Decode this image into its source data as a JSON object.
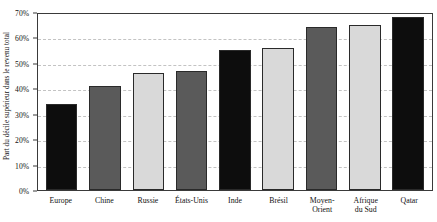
{
  "chart_data": {
    "type": "bar",
    "title": "",
    "xlabel": "",
    "ylabel": "Part du décile supérieur dans le revenu total",
    "ylim": [
      0,
      70
    ],
    "ytick_labels": [
      "0%",
      "10%",
      "20%",
      "30%",
      "40%",
      "50%",
      "60%",
      "70%"
    ],
    "ytick_values": [
      0,
      10,
      20,
      30,
      40,
      50,
      60,
      70
    ],
    "grid": true,
    "gridlines_at": [
      10,
      20,
      30,
      40,
      50,
      60
    ],
    "legend": "none",
    "categories": [
      "Europe",
      "Chine",
      "Russie",
      "États-Unis",
      "Inde",
      "Brésil",
      "Moyen-Orient",
      "Afrique du Sud",
      "Qatar"
    ],
    "category_lines": [
      [
        "Europe"
      ],
      [
        "Chine"
      ],
      [
        "Russie"
      ],
      [
        "États-Unis"
      ],
      [
        "Inde"
      ],
      [
        "Brésil"
      ],
      [
        "Moyen-Orient"
      ],
      [
        "Afrique",
        "du Sud"
      ],
      [
        "Qatar"
      ]
    ],
    "values": [
      34,
      41,
      46,
      47,
      55,
      56,
      64,
      65,
      68
    ],
    "bar_colors": [
      "#0d0d0d",
      "#5a5a5a",
      "#d9d9d9",
      "#5a5a5a",
      "#0d0d0d",
      "#d9d9d9",
      "#5a5a5a",
      "#d9d9d9",
      "#0d0d0d"
    ],
    "bar_edge_color": "#2a2a2a",
    "axis_color": "#3a3a3a",
    "grid_color": "#c3c3c3",
    "background_color": "#ffffff"
  }
}
